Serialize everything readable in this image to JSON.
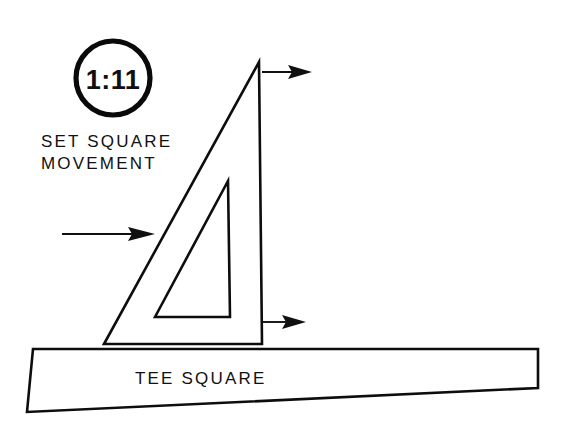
{
  "figure": {
    "background_color": "#ffffff",
    "ink_color": "#101010",
    "width": 580,
    "height": 424
  },
  "badge": {
    "name": "figure-number-badge",
    "value": "1:11",
    "shape": "circle",
    "center_x": 113,
    "center_y": 78,
    "radius": 37,
    "stroke_width": 5
  },
  "labels": {
    "set_square_line1": "SET SQUARE",
    "set_square_line2": "MOVEMENT",
    "tee_square": "TEE SQUARE"
  },
  "set_square": {
    "name": "set-square",
    "description": "right triangle with vertical right edge and inner triangular cutout",
    "outer_points": "104,344 259,62 262,344",
    "inner_points": "155,317 228,181 230,317"
  },
  "tee_square": {
    "name": "tee-square",
    "description": "long tapered blade of the tee square running across the lower part of the drawing",
    "points": "33,349 538,349 538,388 27,412"
  },
  "arrows": [
    {
      "name": "arrow-top-right",
      "direction": "right",
      "shaft_start_x": 262,
      "shaft_end_x": 296,
      "y": 72,
      "tip_x": 312
    },
    {
      "name": "arrow-left-into-hypotenuse",
      "direction": "right",
      "shaft_start_x": 62,
      "shaft_end_x": 133,
      "y": 234,
      "tip_x": 155
    },
    {
      "name": "arrow-bottom-right",
      "direction": "right",
      "shaft_start_x": 262,
      "shaft_end_x": 289,
      "y": 322,
      "tip_x": 306
    }
  ]
}
